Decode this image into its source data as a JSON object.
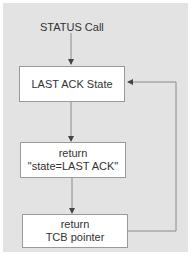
{
  "diagram": {
    "start_label": "STATUS Call",
    "nodes": [
      {
        "id": "last-ack-state",
        "lines": [
          "LAST ACK State"
        ]
      },
      {
        "id": "return-state",
        "lines": [
          "return",
          "\"state=LAST ACK\""
        ]
      },
      {
        "id": "return-tcb",
        "lines": [
          "return",
          "TCB pointer"
        ]
      }
    ],
    "edges": [
      {
        "from": "start",
        "to": "last-ack-state"
      },
      {
        "from": "last-ack-state",
        "to": "return-state"
      },
      {
        "from": "return-state",
        "to": "return-tcb"
      },
      {
        "from": "return-tcb",
        "to": "last-ack-state",
        "type": "feedback"
      }
    ],
    "colors": {
      "background": "#e3e3e3",
      "box": "#ffffff",
      "line": "#8a8a8a"
    }
  }
}
